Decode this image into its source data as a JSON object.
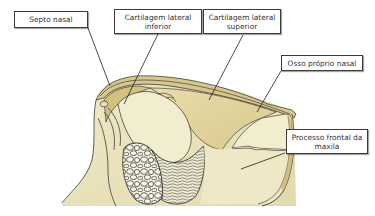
{
  "diagram": {
    "title": "",
    "labels": [
      {
        "id": "septo-nasal",
        "text": "Septo nasal"
      },
      {
        "id": "cartilagem-lateral-inferior",
        "text": "Cartilagem lateral\ninferior"
      },
      {
        "id": "cartilagem-lateral-superior",
        "text": "Cartilagem lateral\nsuperior"
      },
      {
        "id": "osso-proprio-nasal",
        "text": "Osso próprio nasal"
      },
      {
        "id": "processo-frontal-maxila",
        "text": "Processo frontal da\nmaxila"
      }
    ],
    "colors": {
      "skin": "#e9e2bd",
      "cartilage_light": "#f3edcf",
      "cartilage_mid": "#e3d6a2",
      "cartilage_dark": "#c9b777",
      "outline": "#2a2a2a",
      "label_border": "#3a3a3a",
      "label_text": "#333333"
    }
  }
}
